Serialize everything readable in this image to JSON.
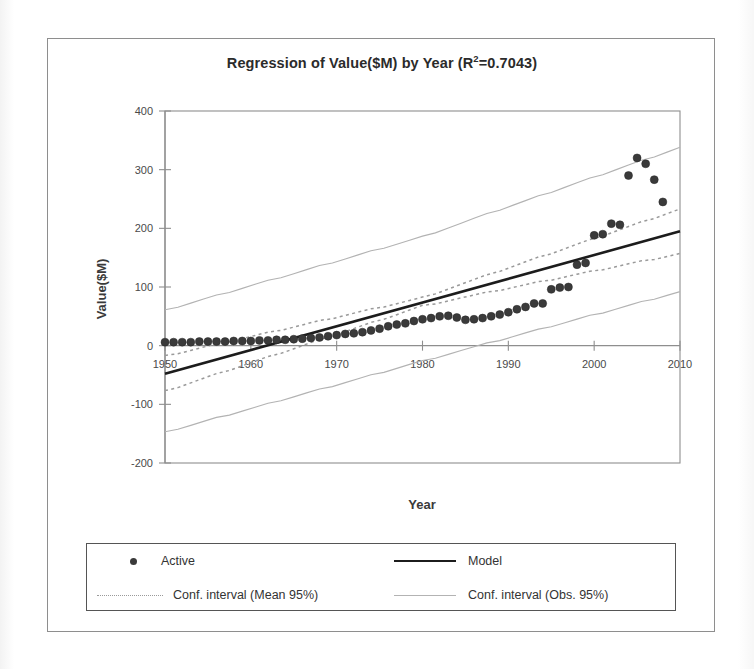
{
  "chart_data": {
    "type": "scatter",
    "title_main": "Regression of Value($M) by Year (R",
    "title_sup": "2",
    "title_tail": "=0.7043)",
    "xlabel": "Year",
    "ylabel": "Value($M)",
    "xlim": [
      1950,
      2010
    ],
    "ylim": [
      -200,
      400
    ],
    "xticks": [
      "1950",
      "1960",
      "1970",
      "1980",
      "1990",
      "2000",
      "2010"
    ],
    "yticks": [
      "400",
      "300",
      "200",
      "100",
      "0",
      "-100",
      "-200"
    ],
    "grid": false,
    "legend_position": "below-plot",
    "r_squared": 0.7043,
    "series": [
      {
        "name": "Active",
        "marker": "filled-circle",
        "color": "#3a3a3a",
        "x": [
          1950,
          1951,
          1952,
          1953,
          1954,
          1955,
          1956,
          1957,
          1958,
          1959,
          1960,
          1961,
          1962,
          1963,
          1964,
          1965,
          1966,
          1967,
          1968,
          1969,
          1970,
          1971,
          1972,
          1973,
          1974,
          1975,
          1976,
          1977,
          1978,
          1979,
          1980,
          1981,
          1982,
          1983,
          1984,
          1985,
          1986,
          1987,
          1988,
          1989,
          1990,
          1991,
          1992,
          1993,
          1994,
          1995,
          1996,
          1997,
          1998,
          1999,
          2000,
          2001,
          2002,
          2003,
          2004,
          2005,
          2006,
          2007,
          2008
        ],
        "y": [
          6,
          6,
          6,
          6,
          7,
          7,
          7,
          7,
          8,
          8,
          8,
          9,
          9,
          10,
          10,
          11,
          12,
          13,
          14,
          16,
          18,
          20,
          21,
          23,
          26,
          29,
          33,
          36,
          38,
          42,
          45,
          47,
          50,
          51,
          48,
          44,
          45,
          47,
          50,
          53,
          57,
          62,
          66,
          72,
          72,
          96,
          99,
          100,
          138,
          141,
          188,
          190,
          208,
          206,
          290,
          320,
          310,
          283,
          245
        ]
      },
      {
        "name": "Model",
        "type": "line",
        "style": "solid",
        "color": "#1c1c1c",
        "x": [
          1950,
          2010
        ],
        "y": [
          -48,
          195
        ]
      },
      {
        "name": "Conf. interval (Mean 95%)",
        "type": "band",
        "style": "dotted",
        "color": "#9a9a9a",
        "x": [
          1950,
          1980,
          2010
        ],
        "upper": [
          -18,
          82,
          233
        ],
        "lower": [
          -78,
          68,
          157
        ]
      },
      {
        "name": "Conf. interval (Obs. 95%)",
        "type": "band",
        "style": "solid-thin",
        "color": "#b3b3b3",
        "x": [
          1950,
          1980,
          2010
        ],
        "upper": [
          60,
          186,
          338
        ],
        "lower": [
          -148,
          -26,
          92
        ]
      }
    ]
  },
  "legend": {
    "items": [
      {
        "label": "Active",
        "key": "dot-marker-icon"
      },
      {
        "label": "Model",
        "key": "solid-line-icon"
      },
      {
        "label": "Conf. interval (Mean 95%)",
        "key": "dotted-line-icon"
      },
      {
        "label": "Conf. interval (Obs. 95%)",
        "key": "thin-line-icon"
      }
    ]
  }
}
